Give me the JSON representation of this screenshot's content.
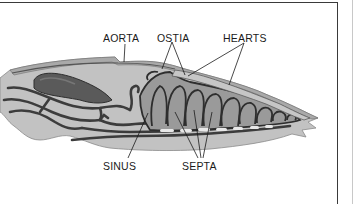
{
  "diagram": {
    "labels": {
      "aorta": "AORTA",
      "ostia": "OSTIA",
      "hearts": "HEARTS",
      "sinus": "SINUS",
      "septa": "SEPTA"
    },
    "colors": {
      "body_fill": "#b9b9b9",
      "body_light": "#cfcfcf",
      "vessel": "#3c3c3c",
      "heart_dark": "#4a4a4a",
      "text": "#1a1a1a",
      "frame": "#3a3a3a"
    }
  }
}
